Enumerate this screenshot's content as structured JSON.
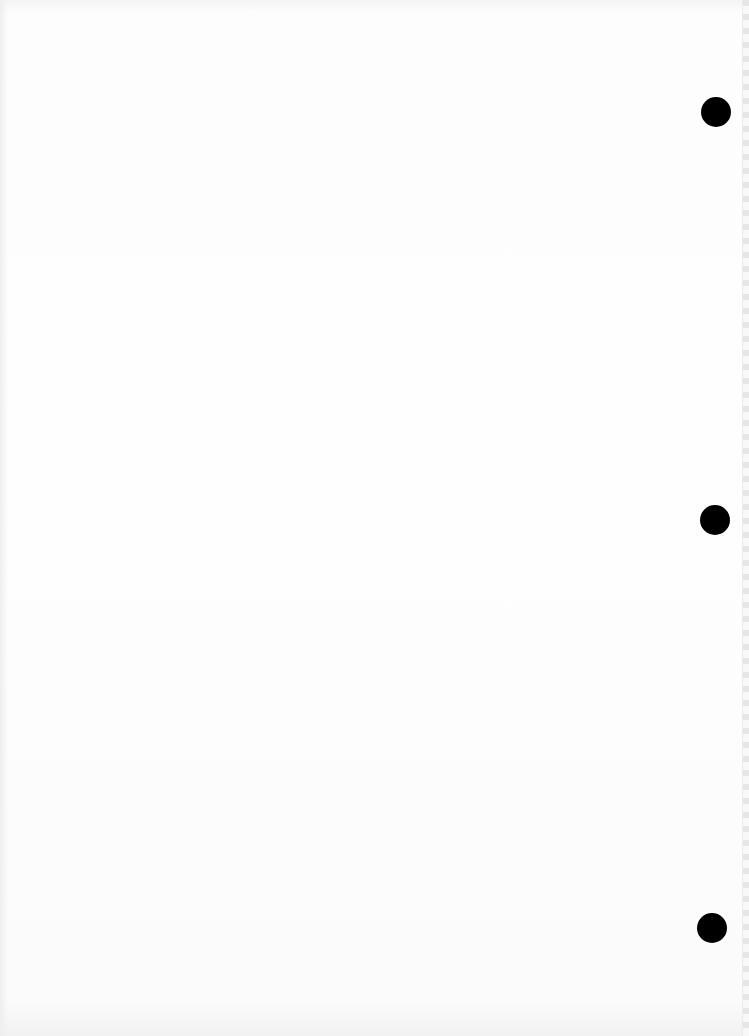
{
  "document": {
    "type": "scanned-page",
    "content": "",
    "punch_holes": [
      {
        "position": "top",
        "color": "#000000"
      },
      {
        "position": "middle",
        "color": "#000000"
      },
      {
        "position": "bottom",
        "color": "#000000"
      }
    ],
    "background_color": "#fefefe"
  }
}
